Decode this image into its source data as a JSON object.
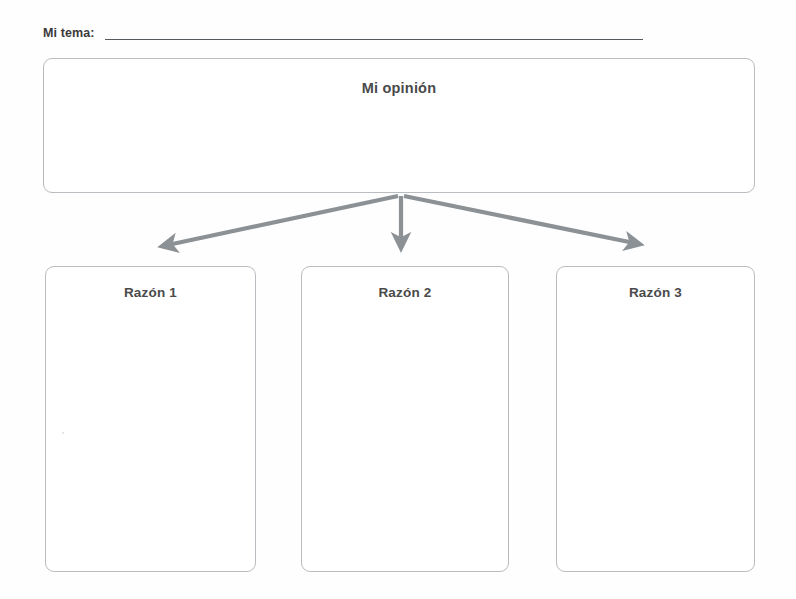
{
  "document": {
    "type": "graphic-organizer",
    "language": "es",
    "background_color": "#ffffff",
    "line_color": "#b9bcc0",
    "arrow_color": "#8c9195",
    "text_color": "#4a4a4a"
  },
  "topic": {
    "label": "Mi tema:",
    "value": "",
    "placeholder": ""
  },
  "opinion": {
    "title": "Mi opinión",
    "value": "",
    "placeholder": ""
  },
  "reasons": [
    {
      "title": "Razón 1",
      "value": "",
      "placeholder": ""
    },
    {
      "title": "Razón 2",
      "value": "",
      "placeholder": ""
    },
    {
      "title": "Razón 3",
      "value": "",
      "placeholder": ""
    }
  ],
  "connectors": [
    {
      "name": "arrow-to-reason-1",
      "from": "opinion",
      "to": "Razón 1",
      "direction": "down-left"
    },
    {
      "name": "arrow-to-reason-2",
      "from": "opinion",
      "to": "Razón 2",
      "direction": "down"
    },
    {
      "name": "arrow-to-reason-3",
      "from": "opinion",
      "to": "Razón 3",
      "direction": "down-right"
    }
  ]
}
